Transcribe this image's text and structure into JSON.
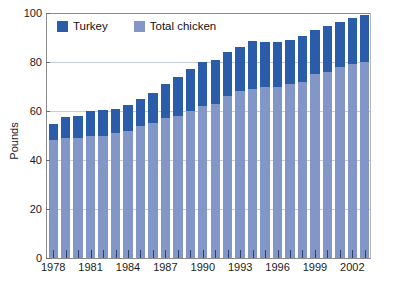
{
  "chart_data": {
    "type": "bar",
    "stacked": true,
    "title": "",
    "subtitle": "",
    "xlabel": "",
    "ylabel": "Pounds",
    "ylim": [
      0,
      100
    ],
    "yticks": [
      0,
      20,
      40,
      60,
      80,
      100
    ],
    "grid": true,
    "legend_position": "top-left",
    "categories": [
      "1978",
      "1979",
      "1980",
      "1981",
      "1982",
      "1983",
      "1984",
      "1985",
      "1986",
      "1987",
      "1988",
      "1989",
      "1990",
      "1991",
      "1992",
      "1993",
      "1994",
      "1995",
      "1996",
      "1997",
      "1998",
      "1999",
      "2000",
      "2001",
      "2002",
      "2003"
    ],
    "xtick_labels": [
      "1978",
      "1981",
      "1984",
      "1987",
      "1990",
      "1993",
      "1996",
      "1999",
      "2002"
    ],
    "xtick_categories": [
      "1978",
      "1981",
      "1984",
      "1987",
      "1990",
      "1993",
      "1996",
      "1999",
      "2002"
    ],
    "series": [
      {
        "name": "Total chicken",
        "color": "#8296c8",
        "values": [
          48,
          49,
          49,
          50,
          50,
          51,
          52,
          54,
          55,
          57,
          58,
          60,
          62,
          63,
          66,
          68,
          69,
          70,
          70,
          71,
          72,
          75,
          76,
          78,
          79,
          80
        ]
      },
      {
        "name": "Turkey",
        "color": "#2a5caa",
        "values": [
          6.5,
          8.5,
          9,
          10,
          10.5,
          10,
          10.5,
          11,
          12.5,
          14,
          16,
          17,
          18,
          18,
          18,
          18,
          19.5,
          18,
          18,
          18,
          18.5,
          18,
          18.5,
          18.5,
          19,
          19
        ]
      }
    ],
    "totals": [
      54.5,
      57.5,
      58,
      60,
      60.5,
      61,
      62.5,
      65,
      67.5,
      71,
      74,
      77,
      80,
      81,
      84,
      86,
      88.5,
      88,
      88,
      89,
      90.5,
      93,
      94.5,
      96.5,
      98,
      99
    ]
  },
  "legend": {
    "items": [
      {
        "label": "Turkey",
        "color": "#2a5caa"
      },
      {
        "label": "Total chicken",
        "color": "#8296c8"
      }
    ]
  },
  "axes": {
    "y_title": "Pounds",
    "y_ticks": [
      "100",
      "80",
      "60",
      "40",
      "20",
      "0"
    ],
    "x_ticks": [
      "1978",
      "1981",
      "1984",
      "1987",
      "1990",
      "1993",
      "1996",
      "1999",
      "2002"
    ]
  },
  "colors": {
    "turkey": "#2a5caa",
    "chicken": "#8296c8",
    "grid": "#c6ccd8",
    "axis": "#8a8a8a",
    "text": "#1a1a1a",
    "background": "#ffffff"
  }
}
